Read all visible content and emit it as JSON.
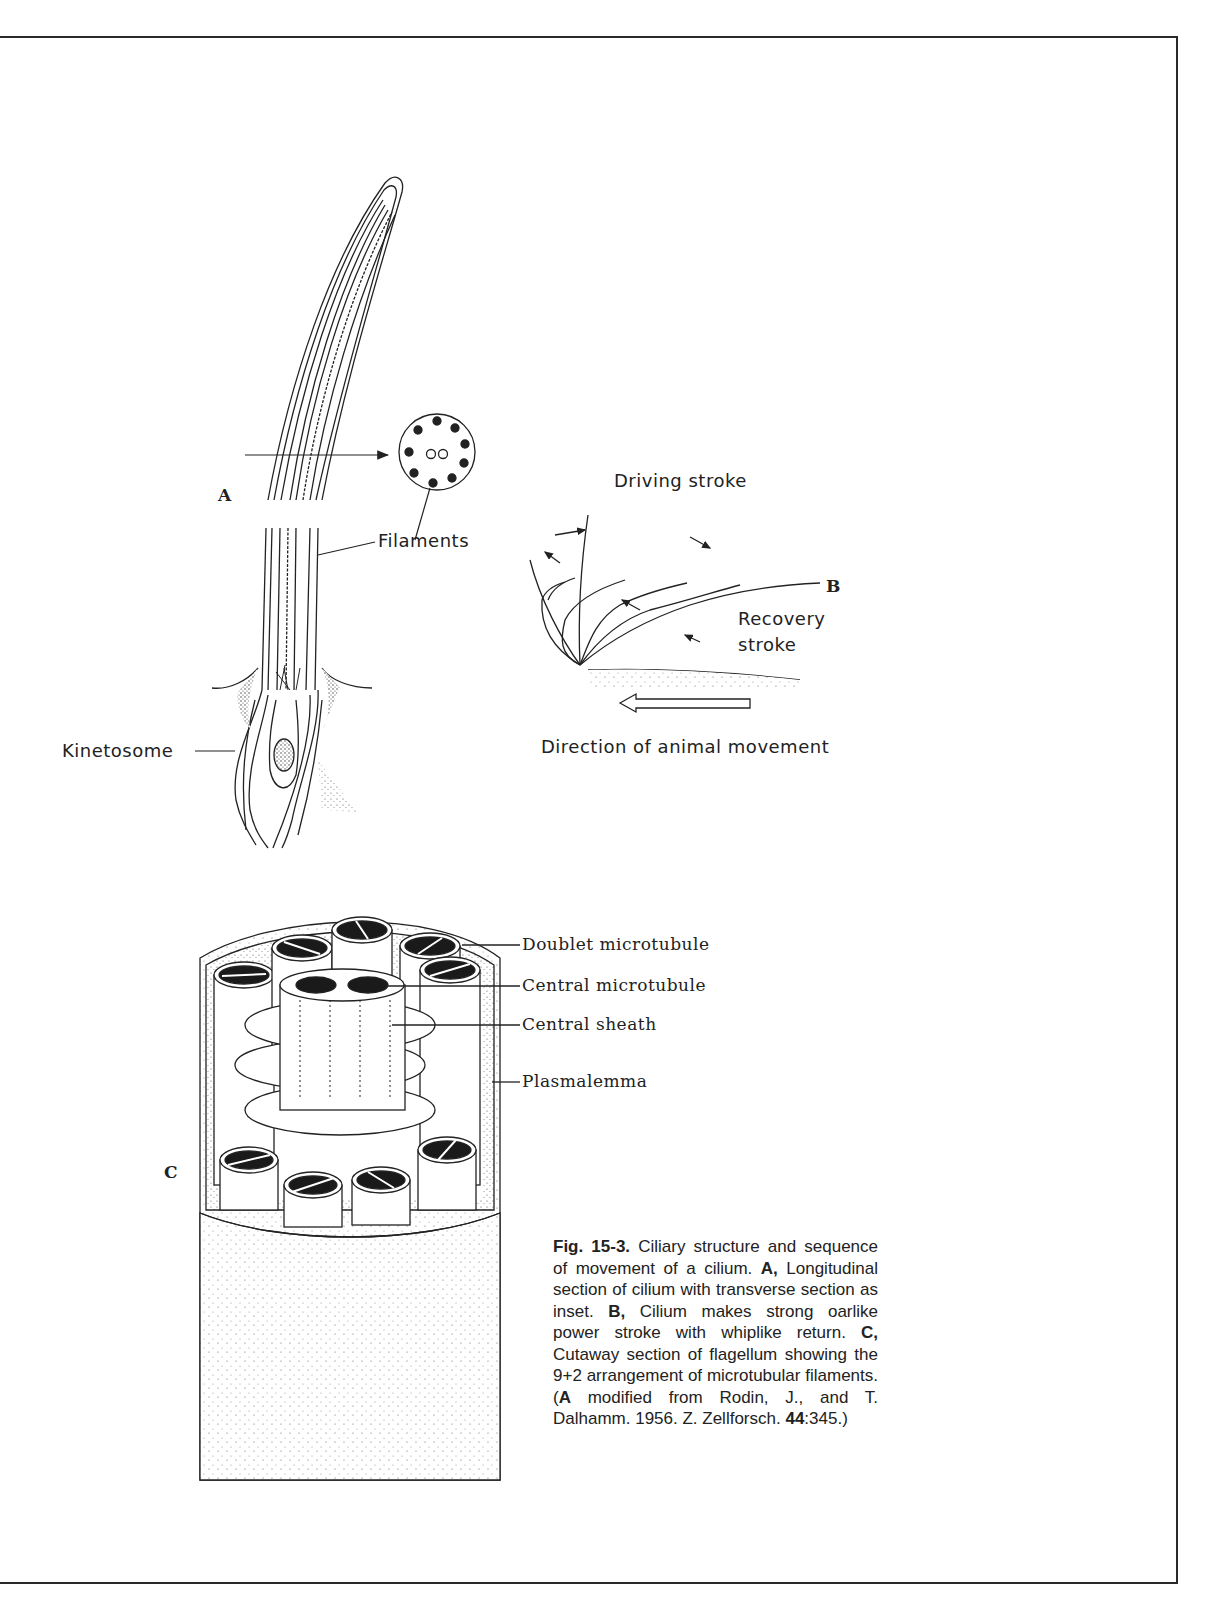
{
  "page": {
    "header_fragment": "Integumentary system / Ciliary structure (cropped)"
  },
  "figure": {
    "number": "Fig. 15-3.",
    "panels": {
      "A": {
        "letter": "A",
        "labels": {
          "filaments": "Filaments",
          "kinetosome": "Kinetosome"
        },
        "inset": "transverse-section-9+2"
      },
      "B": {
        "letter": "B",
        "labels": {
          "driving_stroke": "Driving stroke",
          "recovery_stroke_line1": "Recovery",
          "recovery_stroke_line2": "stroke",
          "direction": "Direction of animal movement"
        }
      },
      "C": {
        "letter": "C",
        "labels": {
          "doublet": "Doublet microtubule",
          "central_microtubule": "Central microtubule",
          "central_sheath": "Central sheath",
          "plasmalemma": "Plasmalemma"
        }
      }
    },
    "caption": {
      "fig_label": "Fig. 15-3.",
      "part1": " Ciliary structure and sequence of movement of a cilium. ",
      "a_label": "A,",
      "part2": " Longitudinal section of cilium with transverse section as inset. ",
      "b_label": "B,",
      "part3": " Cilium makes strong oarlike power stroke with whiplike return. ",
      "c_label": "C,",
      "part4": " Cutaway section of flagellum showing the 9+2 arrangement of microtubular filaments. (",
      "a_label2": "A",
      "part5": " modified from Rodin, J., and T. Dalhamm. 1956. Z. Zellforsch. ",
      "volume": "44",
      "part6": ":345.)"
    }
  }
}
